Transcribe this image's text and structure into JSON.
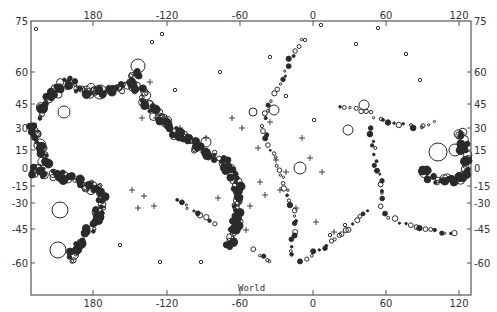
{
  "map": {
    "title": "World",
    "type": "seismicity-map",
    "frame": {
      "left": 31,
      "right": 471,
      "top": 21,
      "bottom": 295
    },
    "colors": {
      "ink": "#2a2a2a",
      "frame": "#555555",
      "background": "#ffffff"
    },
    "x_axis": {
      "ticks": [
        {
          "label": "180",
          "x": 93
        },
        {
          "label": "-120",
          "x": 167
        },
        {
          "label": "-60",
          "x": 240
        },
        {
          "label": "0",
          "x": 313
        },
        {
          "label": "60",
          "x": 386
        },
        {
          "label": "120",
          "x": 459
        }
      ]
    },
    "y_axis": {
      "ticks": [
        {
          "label": "75",
          "y": 21
        },
        {
          "label": "60",
          "y": 72
        },
        {
          "label": "45",
          "y": 104
        },
        {
          "label": "30",
          "y": 128
        },
        {
          "label": "15",
          "y": 150
        },
        {
          "label": "0",
          "y": 168
        },
        {
          "label": "-15",
          "y": 186
        },
        {
          "label": "-30",
          "y": 203
        },
        {
          "label": "-45",
          "y": 229
        },
        {
          "label": "-60",
          "y": 263
        }
      ]
    },
    "legend_symbols": {
      "open_circle": "event (size = magnitude)",
      "filled_circle": "dense event cluster",
      "plus": "event marker"
    }
  }
}
